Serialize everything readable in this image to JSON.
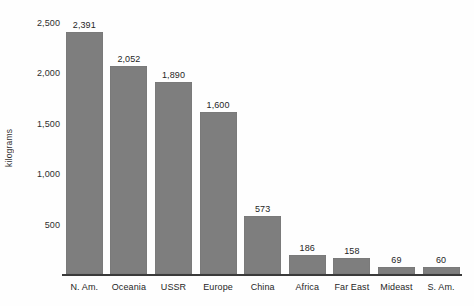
{
  "chart_data": {
    "type": "bar",
    "title": "",
    "subtitle": "",
    "xlabel": "",
    "ylabel": "kilograms",
    "ylim": [
      0,
      2600
    ],
    "grid": false,
    "legend": null,
    "orientation": "vertical",
    "bar_color": "#7e7e7e",
    "background_color": "#fefefe",
    "categories": [
      "N. Am.",
      "Oceania",
      "USSR",
      "Europe",
      "China",
      "Africa",
      "Far East",
      "Mideast",
      "S. Am."
    ],
    "values": [
      2391,
      2052,
      1890,
      1600,
      573,
      186,
      158,
      69,
      60
    ],
    "value_labels": [
      "2,391",
      "2,052",
      "1,890",
      "1,600",
      "573",
      "186",
      "158",
      "69",
      "60"
    ],
    "y_ticks": [
      500,
      1000,
      1500,
      2000,
      2500
    ],
    "y_tick_labels": [
      "500",
      "1,000",
      "1,500",
      "2,000",
      "2,500"
    ]
  }
}
